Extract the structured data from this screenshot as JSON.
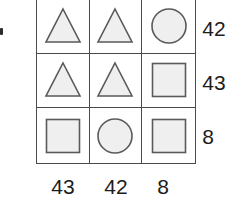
{
  "figure": {
    "name": "shape-matrix-puzzle",
    "grid": {
      "rows": 3,
      "cols": 3,
      "cells": [
        [
          {
            "shape": "triangle-icon",
            "label": "triangle"
          },
          {
            "shape": "triangle-icon",
            "label": "triangle"
          },
          {
            "shape": "circle-icon",
            "label": "circle"
          }
        ],
        [
          {
            "shape": "triangle-icon",
            "label": "triangle"
          },
          {
            "shape": "triangle-icon",
            "label": "triangle"
          },
          {
            "shape": "square-icon",
            "label": "square"
          }
        ],
        [
          {
            "shape": "square-icon",
            "label": "square"
          },
          {
            "shape": "circle-icon",
            "label": "circle"
          },
          {
            "shape": "square-icon",
            "label": "square"
          }
        ]
      ]
    },
    "row_labels": [
      "42",
      "43",
      "8"
    ],
    "col_labels": [
      "43",
      "42",
      "8"
    ],
    "colors": {
      "grid_line": "#4a4a4a",
      "shape_stroke": "#5a5a5a",
      "shape_fill": "#efefef",
      "text": "#1c1c1c",
      "background": "#ffffff"
    }
  }
}
